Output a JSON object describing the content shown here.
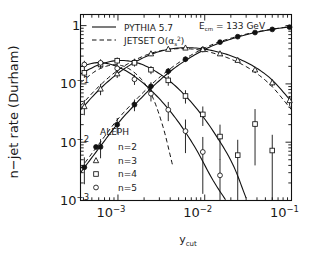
{
  "chart_data": {
    "type": "scatter",
    "title": "",
    "xlabel": "y_cut",
    "ylabel": "n-jet rate (Durham)",
    "xscale": "log",
    "yscale": "log",
    "xlim": [
      0.00037,
      0.1
    ],
    "ylim": [
      0.001,
      1.55
    ],
    "xticks": [
      0.001,
      0.01,
      0.1
    ],
    "xtick_labels": [
      "10−3",
      "10−2",
      "10−1"
    ],
    "yticks": [
      1,
      0.1,
      0.01,
      0.001
    ],
    "ytick_labels": [
      "1",
      "10−1",
      "10−2",
      "10−3"
    ],
    "grid": false,
    "annotations": {
      "energy": "E",
      "energy_sub": "cm",
      "energy_value": "= 133 GeV",
      "experiment": "ALEPH"
    },
    "legend_models": [
      {
        "label": "PYTHIA 5.7",
        "style": "solid"
      },
      {
        "label": "JETSET O(α",
        "style": "dashed",
        "sup": "2",
        "sub": "s",
        "tail": ")"
      }
    ],
    "legend_markers": [
      {
        "label": "n=2",
        "marker": "filled-circle"
      },
      {
        "label": "n=3",
        "marker": "open-triangle"
      },
      {
        "label": "n=4",
        "marker": "open-square"
      },
      {
        "label": "n=5",
        "marker": "open-circle"
      }
    ],
    "series": [
      {
        "name": "n=2",
        "marker": "filled-circle",
        "x": [
          0.00041,
          0.00063,
          0.00098,
          0.00155,
          0.0024,
          0.0038,
          0.006,
          0.0095,
          0.015,
          0.024,
          0.038,
          0.06,
          0.095
        ],
        "y": [
          0.0037,
          0.0083,
          0.02,
          0.044,
          0.091,
          0.165,
          0.265,
          0.39,
          0.52,
          0.645,
          0.76,
          0.86,
          0.94
        ],
        "yerr": [
          0.0018,
          0.003,
          0.006,
          0.01,
          0.016,
          0.022,
          0.028,
          0.032,
          0.034,
          0.034,
          0.03,
          0.026,
          0.02
        ]
      },
      {
        "name": "n=3",
        "marker": "open-triangle",
        "x": [
          0.00041,
          0.00063,
          0.00098,
          0.00155,
          0.0024,
          0.0038,
          0.006,
          0.0095,
          0.015,
          0.024,
          0.038,
          0.06,
          0.095
        ],
        "y": [
          0.041,
          0.082,
          0.15,
          0.24,
          0.33,
          0.395,
          0.415,
          0.39,
          0.33,
          0.255,
          0.175,
          0.105,
          0.052
        ],
        "yerr": [
          0.012,
          0.018,
          0.024,
          0.028,
          0.03,
          0.03,
          0.03,
          0.028,
          0.026,
          0.022,
          0.018,
          0.014,
          0.01
        ]
      },
      {
        "name": "n=4",
        "marker": "open-square",
        "x": [
          0.00041,
          0.00063,
          0.00098,
          0.00155,
          0.0024,
          0.0038,
          0.006,
          0.0095,
          0.015,
          0.024,
          0.038,
          0.06
        ],
        "y": [
          0.155,
          0.215,
          0.25,
          0.23,
          0.175,
          0.115,
          0.062,
          0.03,
          0.0125,
          0.006,
          0.0205,
          0.0072
        ],
        "yerr": [
          0.028,
          0.032,
          0.034,
          0.032,
          0.028,
          0.022,
          0.016,
          0.011,
          0.0075,
          0.005,
          0.0165,
          0.0062
        ]
      },
      {
        "name": "n=5",
        "marker": "open-circle",
        "x": [
          0.00041,
          0.00063,
          0.00098,
          0.00155,
          0.0024,
          0.0038,
          0.006,
          0.0095,
          0.015
        ],
        "y": [
          0.215,
          0.23,
          0.185,
          0.12,
          0.068,
          0.036,
          0.0155,
          0.0068,
          0.0027
        ],
        "yerr": [
          0.034,
          0.034,
          0.03,
          0.024,
          0.018,
          0.013,
          0.009,
          0.0055,
          0.0024
        ]
      }
    ],
    "model_curves": [
      {
        "name": "PYTHIA 5.7 n=2",
        "style": "solid",
        "x": [
          0.00037,
          0.0006,
          0.001,
          0.0017,
          0.0028,
          0.0046,
          0.0076,
          0.0125,
          0.021,
          0.035,
          0.058,
          0.1
        ],
        "y": [
          0.003,
          0.0078,
          0.021,
          0.05,
          0.104,
          0.192,
          0.312,
          0.455,
          0.6,
          0.738,
          0.855,
          0.965
        ]
      },
      {
        "name": "JETSET n=2",
        "style": "dashed",
        "x": [
          0.00037,
          0.0006,
          0.001,
          0.0017,
          0.0028,
          0.0046,
          0.0076,
          0.0125,
          0.021,
          0.035,
          0.058,
          0.1
        ],
        "y": [
          0.0035,
          0.0092,
          0.025,
          0.058,
          0.118,
          0.212,
          0.335,
          0.48,
          0.62,
          0.752,
          0.862,
          0.968
        ]
      },
      {
        "name": "PYTHIA 5.7 n=3",
        "style": "solid",
        "x": [
          0.00037,
          0.0006,
          0.001,
          0.0017,
          0.0028,
          0.0046,
          0.0076,
          0.0125,
          0.021,
          0.035,
          0.058,
          0.1
        ],
        "y": [
          0.036,
          0.078,
          0.152,
          0.252,
          0.348,
          0.408,
          0.414,
          0.37,
          0.296,
          0.208,
          0.122,
          0.05
        ]
      },
      {
        "name": "JETSET n=3",
        "style": "dashed",
        "x": [
          0.00037,
          0.0006,
          0.001,
          0.0017,
          0.0028,
          0.0046,
          0.0076,
          0.0125,
          0.021,
          0.035,
          0.058,
          0.1
        ],
        "y": [
          0.042,
          0.09,
          0.172,
          0.272,
          0.358,
          0.4,
          0.392,
          0.338,
          0.258,
          0.172,
          0.094,
          0.036
        ]
      },
      {
        "name": "PYTHIA 5.7 n=4",
        "style": "solid",
        "x": [
          0.00037,
          0.0006,
          0.001,
          0.0017,
          0.0028,
          0.0046,
          0.0076,
          0.0125,
          0.021,
          0.03
        ],
        "y": [
          0.148,
          0.212,
          0.252,
          0.228,
          0.16,
          0.092,
          0.042,
          0.0155,
          0.0042,
          0.0011
        ]
      },
      {
        "name": "JETSET n=4",
        "style": "dashed",
        "x": [
          0.00037,
          0.0006,
          0.001,
          0.0016,
          0.0024,
          0.0033,
          0.0043
        ],
        "y": [
          0.105,
          0.178,
          0.212,
          0.15,
          0.068,
          0.0185,
          0.0038
        ]
      },
      {
        "name": "PYTHIA 5.7 n=5",
        "style": "solid",
        "x": [
          0.00037,
          0.0006,
          0.001,
          0.0017,
          0.0028,
          0.0046,
          0.0076,
          0.0125,
          0.018
        ],
        "y": [
          0.2,
          0.232,
          0.196,
          0.122,
          0.062,
          0.026,
          0.0085,
          0.0022,
          0.00095
        ]
      }
    ]
  }
}
